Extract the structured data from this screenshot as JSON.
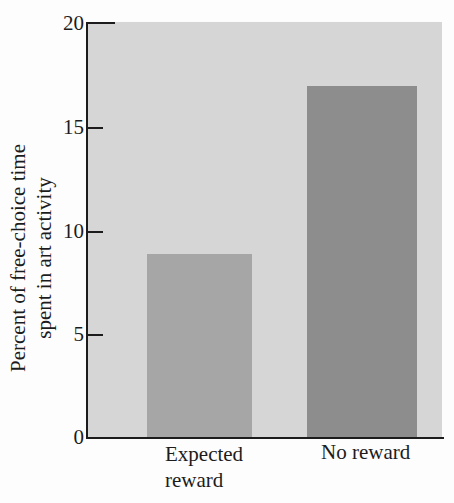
{
  "figure": {
    "ylabel_line1": "Percent of free-choice time",
    "ylabel_line2": "spent in art activity",
    "yticks": {
      "t20": "20",
      "t15": "15",
      "t10": "10",
      "t5": "5",
      "t0": "0"
    },
    "categories": {
      "expected": {
        "line1": "Expected",
        "line2": "reward"
      },
      "noreward": {
        "line1": "No reward",
        "line2": ""
      }
    }
  },
  "chart_data": {
    "type": "bar",
    "categories": [
      "Expected reward",
      "No reward"
    ],
    "values": [
      8.9,
      17
    ],
    "title": "",
    "xlabel": "",
    "ylabel": "Percent of free-choice time spent in art activity",
    "ylim": [
      0,
      20
    ],
    "yticks": [
      0,
      5,
      10,
      15,
      20
    ],
    "grid": false,
    "legend": "none",
    "plot_background_color": "#d6d6d6",
    "bar_colors": [
      "#a6a6a6",
      "#8d8d8d"
    ],
    "axis_color": "#1c1c1c",
    "page_background_color": "#fdfdfd"
  }
}
